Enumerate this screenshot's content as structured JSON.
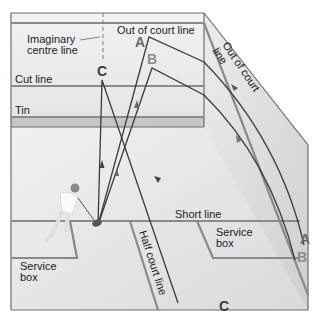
{
  "diagram": {
    "labels": {
      "imaginary_centre_line_1": "Imaginary",
      "imaginary_centre_line_2": "centre line",
      "out_of_court_line_front": "Out of court line",
      "out_of_court_line_side_1": "Out of court",
      "out_of_court_line_side_2": "line",
      "cut_line": "Cut line",
      "tin": "Tin",
      "short_line": "Short line",
      "service_box_right_1": "Service",
      "service_box_right_2": "box",
      "service_box_left_1": "Service",
      "service_box_left_2": "box",
      "half_court_line": "Half court line"
    },
    "shot_paths": [
      {
        "id": "A",
        "label_top": "A",
        "label_bottom": "A",
        "color": "#6a6a6a"
      },
      {
        "id": "B",
        "label_top": "B",
        "label_bottom": "B",
        "color": "#8c8c8c"
      },
      {
        "id": "C",
        "label_top": "C",
        "label_bottom": "C",
        "color": "#3a3a3a"
      }
    ],
    "colors": {
      "wall": "#eeeeee",
      "side_wall": "#e2e2e2",
      "floor": "#e6e6e6",
      "tin": "#c4c4c4",
      "court_line": "#8a8a8a",
      "shot_line": "#3c3c3c"
    }
  }
}
